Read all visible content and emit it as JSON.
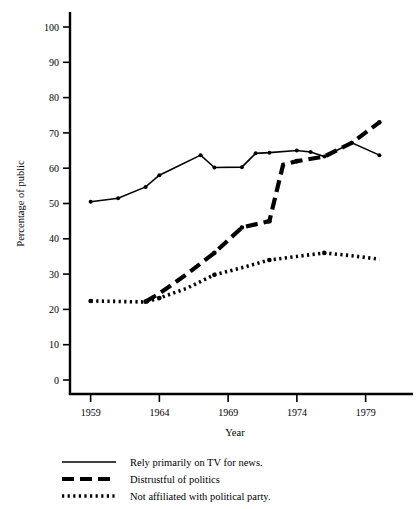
{
  "chart_data": {
    "type": "line",
    "title": "",
    "xlabel": "Year",
    "ylabel": "Percentage of public",
    "xlim": [
      1957.5,
      1981.5
    ],
    "ylim": [
      0,
      100
    ],
    "xticks": [
      1959,
      1964,
      1969,
      1974,
      1979
    ],
    "xtick_labels": [
      "1959",
      "1964",
      "1969",
      "1974",
      "1979"
    ],
    "yticks": [
      0,
      10,
      20,
      30,
      40,
      50,
      60,
      70,
      80,
      90,
      100
    ],
    "ytick_labels": [
      "0",
      "10",
      "20",
      "30",
      "40",
      "50",
      "60",
      "70",
      "80",
      "90",
      "100"
    ],
    "grid": false,
    "legend_position": "below",
    "series": [
      {
        "name": "Rely primarily on TV for news.",
        "style": "solid",
        "marker": "dot",
        "x": [
          1959,
          1961,
          1963,
          1964,
          1967,
          1968,
          1970,
          1971,
          1972,
          1974,
          1975,
          1976,
          1978,
          1980
        ],
        "values": [
          50.5,
          51.5,
          54.7,
          58.0,
          63.7,
          60.2,
          60.3,
          64.2,
          64.4,
          65.0,
          64.6,
          63.3,
          67.2,
          63.7
        ]
      },
      {
        "name": "Distrustful of politics",
        "style": "dashed",
        "marker": "dot",
        "x": [
          1963,
          1964,
          1966,
          1968,
          1970,
          1972,
          1973,
          1974,
          1976,
          1978,
          1980
        ],
        "values": [
          22.2,
          24.5,
          30.0,
          36.0,
          43.2,
          45.0,
          61.0,
          62.0,
          63.3,
          67.2,
          73.0
        ]
      },
      {
        "name": "Not affiliated with political party.",
        "style": "dotted",
        "marker": "dot",
        "x": [
          1959,
          1963,
          1964,
          1966,
          1968,
          1970,
          1972,
          1974,
          1976,
          1978,
          1980
        ],
        "values": [
          22.4,
          22.1,
          23.2,
          26.0,
          29.8,
          31.8,
          34.0,
          35.0,
          36.0,
          35.2,
          34.2
        ]
      }
    ]
  },
  "legend": {
    "items": [
      {
        "label": "Rely primarily on TV for news.",
        "style": "solid"
      },
      {
        "label": "Distrustful of politics",
        "style": "dashed"
      },
      {
        "label": "Not affiliated with political party.",
        "style": "dotted"
      }
    ]
  }
}
